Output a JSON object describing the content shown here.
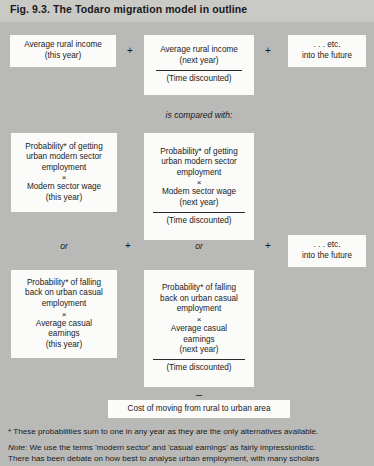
{
  "figure": {
    "label": "Fig. 9.3.",
    "title": "The Todaro migration model in outline"
  },
  "colors": {
    "background": "#b9b9b7",
    "title_band": "#c9c9c6",
    "box_fill": "#fbfbfa",
    "text": "#1a1a1a",
    "rule": "#2a2a2a"
  },
  "row1": {
    "box1": {
      "line1": "Average rural income",
      "line2": "(this year)"
    },
    "op1": "+",
    "box2": {
      "line1": "Average rural income",
      "line2": "(next year)",
      "denominator": "(Time discounted)"
    },
    "op2": "+",
    "box3": {
      "line1": ". . . etc.",
      "line2": "into the future"
    }
  },
  "connector1": "is compared with:",
  "row2": {
    "box1": {
      "line1": "Probability* of getting",
      "line2": "urban modern sector",
      "line3": "employment",
      "times": "×",
      "line4": "Modern sector wage",
      "line5": "(this year)"
    },
    "box2": {
      "line1": "Probability* of getting",
      "line2": "urban modern sector",
      "line3": "employment",
      "times": "×",
      "line4": "Modern sector wage",
      "line5": "(next year)",
      "denominator": "(Time discounted)"
    }
  },
  "row_or": {
    "or1": "or",
    "plus1": "+",
    "or2": "or",
    "plus2": "+",
    "box3": {
      "line1": ". . . etc.",
      "line2": "into the future"
    }
  },
  "row3": {
    "box1": {
      "line1": "Probability* of falling",
      "line2": "back on urban casual",
      "line3": "employment",
      "times": "×",
      "line4": "Average casual",
      "line5": "earnings",
      "line6": "(this year)"
    },
    "box2": {
      "line1": "Probability* of falling",
      "line2": "back on urban casual",
      "line3": "employment",
      "times": "×",
      "line4": "Average casual",
      "line5": "earnings",
      "line6": "(next year)",
      "denominator": "(Time discounted)"
    }
  },
  "minus": "–",
  "cost_box": {
    "label": "Cost of moving from rural to urban area"
  },
  "notes": {
    "star_note": "* These probabilities sum to one in any year as they are the only alternatives available.",
    "note_label": "Note:",
    "note_line1": "We use the terms 'modern sector' and 'casual earnings' as fairly impressionistic.",
    "note_line2": "There has been debate on how best to analyse urban employment, with many scholars"
  }
}
